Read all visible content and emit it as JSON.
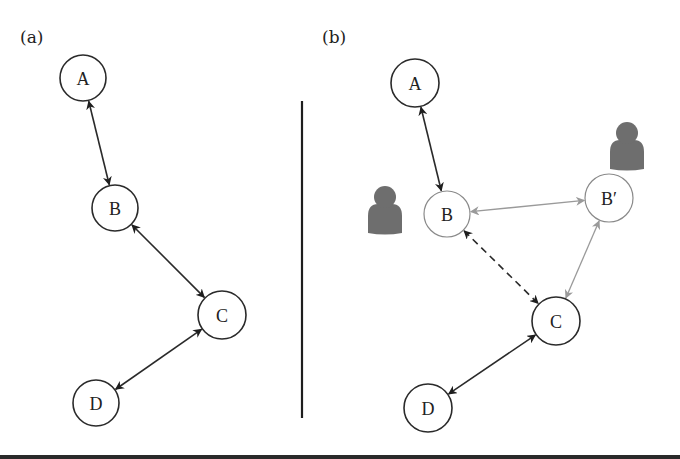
{
  "panels": [
    {
      "id": "a",
      "label": "(a)",
      "label_pos": [
        20,
        43
      ],
      "nodes": [
        {
          "id": "A",
          "label": "A",
          "cx": 83,
          "cy": 78,
          "r": 23,
          "style": "dark"
        },
        {
          "id": "B",
          "label": "B",
          "cx": 115,
          "cy": 208,
          "r": 23,
          "style": "dark"
        },
        {
          "id": "C",
          "label": "C",
          "cx": 222,
          "cy": 315,
          "r": 24,
          "style": "dark"
        },
        {
          "id": "D",
          "label": "D",
          "cx": 96,
          "cy": 403,
          "r": 23,
          "style": "dark"
        }
      ],
      "edges": [
        {
          "from": "A",
          "to": "B",
          "type": "bidirectional",
          "style": "solid-dark"
        },
        {
          "from": "B",
          "to": "C",
          "type": "bidirectional",
          "style": "solid-dark"
        },
        {
          "from": "C",
          "to": "D",
          "type": "bidirectional",
          "style": "solid-dark"
        }
      ],
      "persons": []
    },
    {
      "id": "b",
      "label": "(b)",
      "label_pos": [
        322,
        43
      ],
      "nodes": [
        {
          "id": "A",
          "label": "A",
          "cx": 415,
          "cy": 83,
          "r": 24,
          "style": "dark"
        },
        {
          "id": "B",
          "label": "B",
          "cx": 447,
          "cy": 214,
          "r": 23,
          "style": "light"
        },
        {
          "id": "Bp",
          "label": "B′",
          "cx": 609,
          "cy": 198,
          "r": 24,
          "style": "light"
        },
        {
          "id": "C",
          "label": "C",
          "cx": 556,
          "cy": 321,
          "r": 24,
          "style": "dark"
        },
        {
          "id": "D",
          "label": "D",
          "cx": 428,
          "cy": 408,
          "r": 24,
          "style": "dark"
        }
      ],
      "edges": [
        {
          "from": "A",
          "to": "B",
          "type": "bidirectional",
          "style": "solid-dark"
        },
        {
          "from": "B",
          "to": "Bp",
          "type": "bidirectional",
          "style": "solid-light"
        },
        {
          "from": "Bp",
          "to": "C",
          "type": "bidirectional",
          "style": "solid-light"
        },
        {
          "from": "B",
          "to": "C",
          "type": "bidirectional",
          "style": "dashed-dark"
        },
        {
          "from": "C",
          "to": "D",
          "type": "bidirectional",
          "style": "solid-dark"
        }
      ],
      "persons": [
        {
          "id": "person-near-B",
          "icon": "person-icon",
          "head": [
            385,
            197,
            11
          ],
          "body": [
            368,
            204,
            34,
            29
          ]
        },
        {
          "id": "person-near-Bp",
          "icon": "person-icon",
          "head": [
            627,
            133,
            11
          ],
          "body": [
            610,
            140,
            34,
            29
          ]
        }
      ]
    }
  ],
  "divider": {
    "x": 302,
    "y1": 101,
    "y2": 418
  },
  "colors": {
    "dark": "#2a2a2a",
    "light_edge": "#9a9a9a",
    "light_node": "#8a8a8a",
    "person": "#6e6e6e"
  }
}
